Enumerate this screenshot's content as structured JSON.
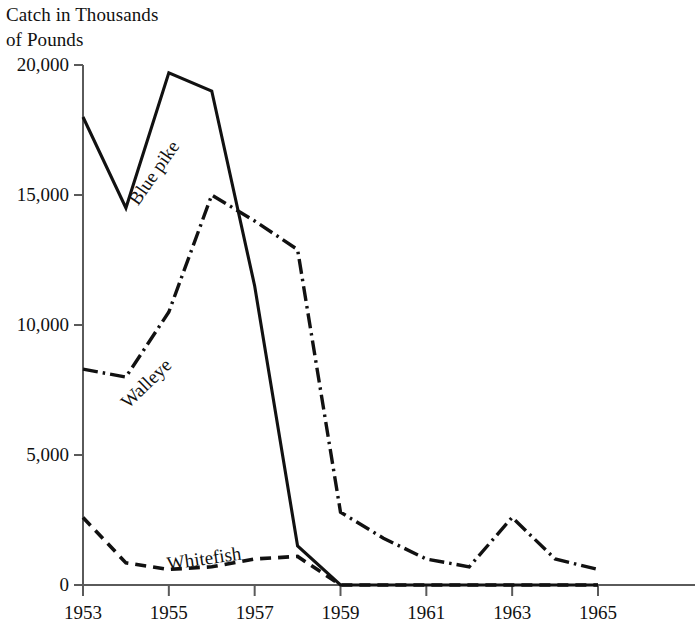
{
  "chart_data": {
    "type": "line",
    "ylabel": "Catch in Thousands of Pounds",
    "xlabel": "",
    "x": [
      1953,
      1954,
      1955,
      1956,
      1957,
      1958,
      1959,
      1960,
      1961,
      1962,
      1963,
      1964,
      1965
    ],
    "xlim": [
      1953,
      1965
    ],
    "ylim": [
      0,
      20000
    ],
    "grid": false,
    "legend_position": "inline-labels",
    "xticks": [
      "1953",
      "1955",
      "1957",
      "1959",
      "1961",
      "1963",
      "1965"
    ],
    "xtick_values": [
      1953,
      1955,
      1957,
      1959,
      1961,
      1963,
      1965
    ],
    "yticks": [
      "0",
      "5,000",
      "10,000",
      "15,000",
      "20,000"
    ],
    "ytick_values": [
      0,
      5000,
      10000,
      15000,
      20000
    ],
    "series": [
      {
        "name": "Blue pike",
        "style": "solid",
        "color": "#111111",
        "label_angle": -55,
        "values": [
          18000,
          14500,
          19700,
          19000,
          11500,
          1500,
          0,
          0,
          0,
          0,
          0,
          0,
          0
        ]
      },
      {
        "name": "Walleye",
        "style": "dash-dot",
        "color": "#111111",
        "label_angle": -44,
        "values": [
          8300,
          8000,
          10500,
          15000,
          14000,
          12900,
          2800,
          1800,
          1000,
          700,
          2600,
          1000,
          600
        ]
      },
      {
        "name": "Whitefish",
        "style": "dashed",
        "color": "#111111",
        "label_angle": -8,
        "values": [
          2600,
          850,
          600,
          700,
          1000,
          1100,
          0,
          0,
          0,
          0,
          0,
          0,
          0
        ]
      }
    ]
  },
  "axis": {
    "color": "#4a4a4a",
    "line_color": "#111111"
  },
  "labels": {
    "title_line1": "Catch in Thousands",
    "title_line2": "of Pounds",
    "blue_pike": "Blue pike",
    "walleye": "Walleye",
    "whitefish": "Whitefish"
  }
}
